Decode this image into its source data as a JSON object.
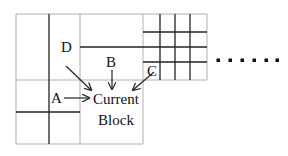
{
  "diagram": {
    "current_block_label_line1": "Current",
    "current_block_label_line2": "Block",
    "neighbors": [
      {
        "id": "A",
        "label": "A"
      },
      {
        "id": "B",
        "label": "B"
      },
      {
        "id": "C",
        "label": "C"
      },
      {
        "id": "D",
        "label": "D"
      }
    ],
    "continuation": "......",
    "colors": {
      "grid_thin": "#b0b0b0",
      "grid_thick": "#222222",
      "text": "#111111"
    }
  }
}
